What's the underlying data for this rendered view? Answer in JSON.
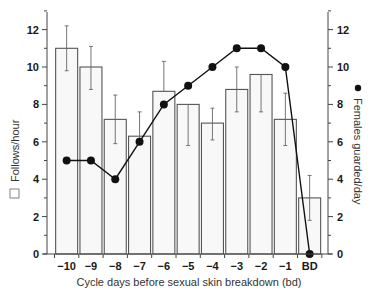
{
  "chart_data": {
    "type": "bar",
    "title": "",
    "xlabel": "Cycle days before sexual skin breakdown (bd)",
    "categories": [
      "-10",
      "-9",
      "-8",
      "-7",
      "-6",
      "-5",
      "-4",
      "-3",
      "-2",
      "-1",
      "BD"
    ],
    "category_labels": [
      "−10",
      "−9",
      "−8",
      "−7",
      "−6",
      "−5",
      "−4",
      "−3",
      "−2",
      "−1",
      "BD"
    ],
    "series": [
      {
        "name": "Follows/hour",
        "type": "bar",
        "axis": "left",
        "legend_icon": "open-square",
        "values": [
          11.0,
          10.0,
          7.2,
          6.3,
          8.7,
          8.0,
          7.0,
          8.8,
          9.6,
          7.2,
          3.0
        ],
        "error_upper": [
          12.2,
          11.1,
          8.5,
          7.6,
          10.3,
          8.0,
          7.8,
          10.0,
          9.6,
          8.6,
          4.2
        ],
        "error_lower": [
          9.8,
          8.8,
          5.9,
          5.9,
          8.7,
          5.8,
          6.1,
          7.6,
          7.6,
          5.8,
          1.8
        ]
      },
      {
        "name": "Females guarded/day",
        "type": "line",
        "axis": "right",
        "legend_icon": "filled-circle",
        "values": [
          5,
          5,
          4,
          6,
          8,
          9,
          10,
          11,
          11,
          10,
          0
        ]
      }
    ],
    "ylabel": "Follows/hour",
    "ylabel_right": "Females guarded/day",
    "ylim": [
      0,
      13
    ],
    "ylim_right": [
      0,
      13
    ],
    "yticks": [
      0,
      2,
      4,
      6,
      8,
      10,
      12
    ],
    "yticks_right": [
      0,
      2,
      4,
      6,
      8,
      10,
      12
    ],
    "grid": false,
    "legend_position": "axis-labels"
  },
  "colors": {
    "bar_fill": "#f8f8f8",
    "bar_stroke": "#555555",
    "line": "#111111",
    "axis": "#444444"
  }
}
